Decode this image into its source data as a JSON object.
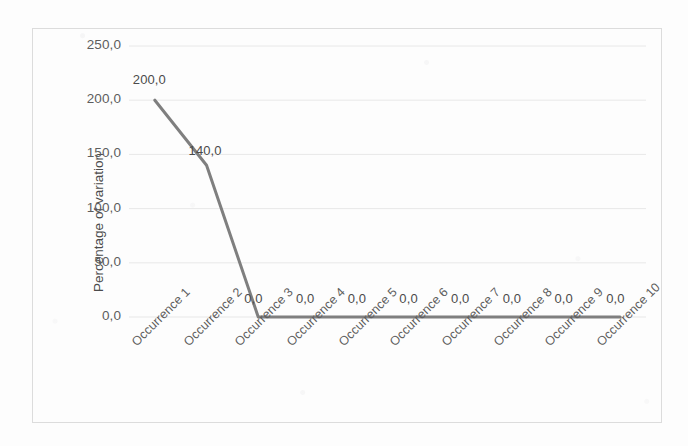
{
  "chart_data": {
    "type": "line",
    "title": "",
    "xlabel": "",
    "ylabel": "Percentage of variation",
    "categories": [
      "Occurrence 1",
      "Occurrence 2",
      "Occurrence 3",
      "Occurrence 4",
      "Occurrence 5",
      "Occurrence 6",
      "Occurrence 7",
      "Occurrence 8",
      "Occurrence 9",
      "Occurrence 10"
    ],
    "values": [
      200.0,
      140.0,
      0.0,
      0.0,
      0.0,
      0.0,
      0.0,
      0.0,
      0.0,
      0.0
    ],
    "data_labels": [
      "200,0",
      "140,0",
      "0,0",
      "0,0",
      "0,0",
      "0,0",
      "0,0",
      "0,0",
      "0,0",
      "0,0"
    ],
    "ylim": [
      0,
      250
    ],
    "ytick_values": [
      250,
      200,
      150,
      100,
      50,
      0
    ],
    "ytick_labels": [
      "250,0",
      "200,0",
      "150,0",
      "100,0",
      "50,0",
      "0,0"
    ],
    "grid": true,
    "legend": false,
    "legend_position": "none",
    "decimal_separator": ",",
    "series_color": "#7f7f7f",
    "gridline_color": "#e8e8e8",
    "border_color": "#dcdcdc",
    "axis_text_color": "#5d5d5d"
  }
}
